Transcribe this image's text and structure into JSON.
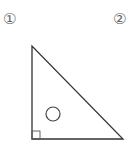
{
  "labels": {
    "first": "①",
    "second": "②"
  },
  "figure": {
    "shape": "right-triangle",
    "vertices": [
      [
        32,
        46
      ],
      [
        32,
        139
      ],
      [
        123,
        139
      ]
    ],
    "right_angle_at": "bottom-left",
    "marker": "○",
    "stroke_color": "#333333",
    "marker_color": "#444444"
  }
}
